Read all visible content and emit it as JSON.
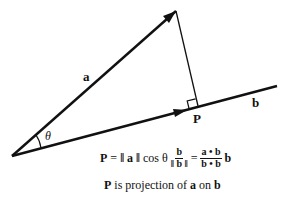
{
  "diagram": {
    "vectors": [
      {
        "name": "a",
        "label": "a",
        "from": [
          12,
          156
        ],
        "to": [
          176,
          11
        ]
      },
      {
        "name": "b",
        "label": "b",
        "from": [
          12,
          156
        ],
        "to": [
          277,
          86
        ]
      }
    ],
    "angle_label": "θ",
    "point_label": "P",
    "formula": {
      "lhs": "P",
      "eq": "=",
      "norm_a": "‖ a ‖",
      "cos": "cos θ",
      "frac1_num": "b",
      "frac1_den": "‖ b ‖",
      "eq2": "=",
      "frac2_num": "a • b",
      "frac2_den": "b • b",
      "trail": "b"
    },
    "caption": {
      "p": "P",
      "text1": " is projection of ",
      "a": "a",
      "text2": " on ",
      "b": "b"
    },
    "colors": {
      "stroke": "#111111",
      "background": "#ffffff"
    }
  }
}
